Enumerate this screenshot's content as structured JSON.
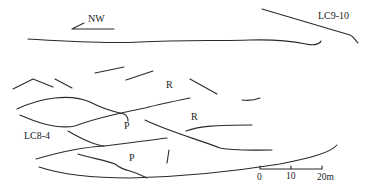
{
  "diagram": {
    "type": "geological outcrop sketch",
    "orientation_label": "NW",
    "labels": {
      "lc9": "LC9-10",
      "lc8": "LC8-4",
      "r1": "R",
      "r2": "R",
      "p1": "P",
      "p2": "P"
    },
    "scale_bar": {
      "ticks": [
        "0",
        "10",
        "20m"
      ],
      "values": [
        0,
        10,
        20
      ],
      "unit": "m"
    },
    "colors": {
      "line": "#2a2a2a",
      "text": "#222222",
      "background": "#ffffff"
    }
  }
}
